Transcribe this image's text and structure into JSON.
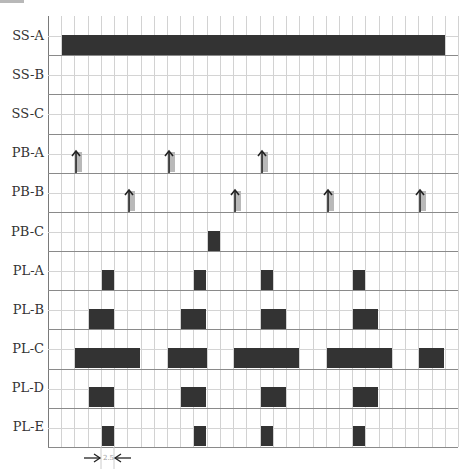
{
  "diagram": {
    "title": "",
    "grid": {
      "columns": 31,
      "rows": 11
    },
    "colors": {
      "block": "#333333",
      "pulse": "#b9b9b9",
      "arrow": "#222222",
      "grid_minor": "#d2d2d2",
      "grid_row": "#8a8a8a"
    },
    "rows": [
      {
        "label": "SS-A",
        "type": "block",
        "segments": [
          [
            1,
            29
          ]
        ]
      },
      {
        "label": "SS-B",
        "type": "block",
        "segments": []
      },
      {
        "label": "SS-C",
        "type": "block",
        "segments": []
      },
      {
        "label": "PB-A",
        "type": "pulse",
        "positions": [
          2,
          9,
          16
        ]
      },
      {
        "label": "PB-B",
        "type": "pulse",
        "positions": [
          6,
          14,
          21,
          28
        ]
      },
      {
        "label": "PB-C",
        "type": "block",
        "segments": [
          [
            12,
            1
          ]
        ]
      },
      {
        "label": "PL-A",
        "type": "block",
        "segments": [
          [
            4,
            1
          ],
          [
            11,
            1
          ],
          [
            16,
            1
          ],
          [
            23,
            1
          ]
        ]
      },
      {
        "label": "PL-B",
        "type": "block",
        "segments": [
          [
            3,
            2
          ],
          [
            10,
            2
          ],
          [
            16,
            2
          ],
          [
            23,
            2
          ]
        ]
      },
      {
        "label": "PL-C",
        "type": "block",
        "segments": [
          [
            2,
            5
          ],
          [
            9,
            3
          ],
          [
            14,
            5
          ],
          [
            21,
            5
          ],
          [
            28,
            2
          ]
        ]
      },
      {
        "label": "PL-D",
        "type": "block",
        "segments": [
          [
            3,
            2
          ],
          [
            10,
            2
          ],
          [
            16,
            2
          ],
          [
            23,
            2
          ]
        ]
      },
      {
        "label": "PL-E",
        "type": "block",
        "segments": [
          [
            4,
            1
          ],
          [
            11,
            1
          ],
          [
            16,
            1
          ],
          [
            23,
            1
          ]
        ]
      }
    ],
    "dimension": {
      "label": "2.5",
      "column": 4
    }
  }
}
